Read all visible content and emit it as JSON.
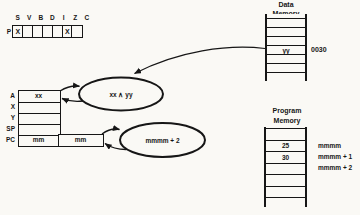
{
  "flag_register": {
    "register_label": "P",
    "flag_names": [
      "S",
      "V",
      "B",
      "D",
      "I",
      "Z",
      "C"
    ],
    "flag_marks": [
      "X",
      "",
      "",
      "",
      "",
      "X",
      ""
    ]
  },
  "cpu_registers": {
    "rows": [
      {
        "label": "A",
        "value": "xx"
      },
      {
        "label": "X",
        "value": ""
      },
      {
        "label": "Y",
        "value": ""
      },
      {
        "label": "SP",
        "value": ""
      },
      {
        "label": "PC",
        "high": "mm",
        "low": "mm"
      }
    ]
  },
  "operations": {
    "and_result": "xx ∧ yy",
    "pc_increment": "mmmm + 2"
  },
  "data_memory": {
    "title_top": "Data",
    "title_bottom": "Memory",
    "cells": [
      "",
      "",
      "",
      "yy",
      "",
      ""
    ],
    "address": "0030"
  },
  "program_memory": {
    "title_top": "Program",
    "title_bottom": "Memory",
    "cells": [
      "",
      "25",
      "30",
      "",
      "",
      ""
    ],
    "addresses": [
      "mmmm",
      "mmmm + 1",
      "mmmm + 2"
    ]
  }
}
